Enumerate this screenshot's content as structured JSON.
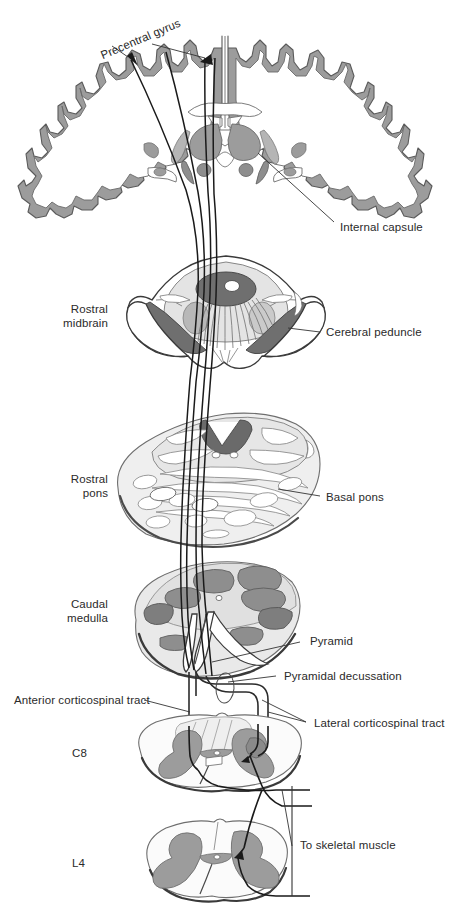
{
  "figure": {
    "type": "anatomical-diagram",
    "background_color": "#ffffff",
    "palette": {
      "outline": "#4a4a4a",
      "dark_outline": "#2b2b2b",
      "gray_matter": "#8e8e8e",
      "gray_matter_light": "#a8a8a8",
      "pale_fill": "#e8e8e8",
      "pale_fill_2": "#dcdcdc",
      "white_fill": "#ffffff",
      "dark_gray": "#6f6f6f",
      "very_dark": "#555555",
      "tract_line": "#1a1a1a",
      "leader_line": "#333333",
      "text": "#2a2a2a"
    },
    "sections": [
      {
        "id": "cerebral-hemispheres",
        "name": "Coronal section of cerebral hemispheres",
        "left_label": null,
        "right_labels": [
          "Internal capsule"
        ],
        "top_labels": [
          "Precentral gyrus"
        ]
      },
      {
        "id": "rostral-midbrain",
        "name": "Rostral midbrain cross-section",
        "left_label": "Rostral midbrain",
        "right_labels": [
          "Cerebral peduncle"
        ]
      },
      {
        "id": "rostral-pons",
        "name": "Rostral pons cross-section",
        "left_label": "Rostral pons",
        "right_labels": [
          "Basal pons"
        ]
      },
      {
        "id": "caudal-medulla",
        "name": "Caudal medulla cross-section",
        "left_label": "Caudal medulla",
        "right_labels": [
          "Pyramid",
          "Pyramidal decussation"
        ]
      },
      {
        "id": "c8-spinal-cord",
        "name": "C8 spinal cord cross-section",
        "left_label": "C8",
        "right_labels": [
          "Lateral corticospinal tract"
        ],
        "other_labels": [
          "Anterior corticospinal tract"
        ]
      },
      {
        "id": "l4-spinal-cord",
        "name": "L4 spinal cord cross-section",
        "left_label": "L4",
        "right_labels": [
          "To skeletal muscle"
        ]
      }
    ]
  },
  "labels": {
    "precentral_gyrus": "Precentral gyrus",
    "internal_capsule": "Internal capsule",
    "rostral_midbrain_l1": "Rostral",
    "rostral_midbrain_l2": "midbrain",
    "cerebral_peduncle": "Cerebral peduncle",
    "rostral_pons_l1": "Rostral",
    "rostral_pons_l2": "pons",
    "basal_pons": "Basal pons",
    "caudal_medulla_l1": "Caudal",
    "caudal_medulla_l2": "medulla",
    "pyramid": "Pyramid",
    "pyramidal_decussation": "Pyramidal decussation",
    "anterior_corticospinal_tract": "Anterior corticospinal tract",
    "lateral_corticospinal_tract": "Lateral corticospinal tract",
    "c8": "C8",
    "l4": "L4",
    "to_skeletal_muscle": "To skeletal muscle"
  }
}
